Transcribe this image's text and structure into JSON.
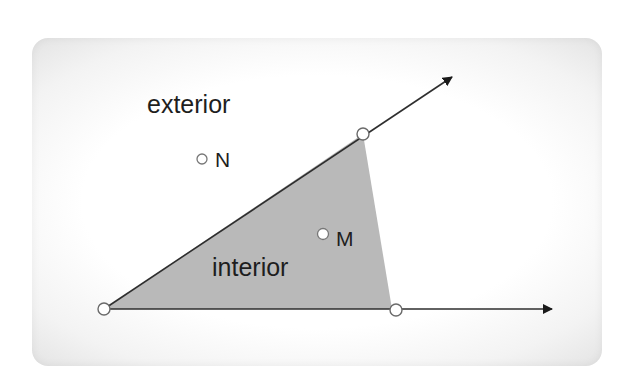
{
  "diagram": {
    "region_labels": {
      "exterior": "exterior",
      "interior": "interior"
    },
    "points": {
      "N": {
        "label": "N",
        "location": "exterior"
      },
      "M": {
        "label": "M",
        "location": "interior"
      }
    },
    "rays": [
      {
        "name": "upper-ray",
        "from": "vertex",
        "direction": "up-right",
        "arrow": true
      },
      {
        "name": "lower-ray",
        "from": "vertex",
        "direction": "right",
        "arrow": true
      }
    ],
    "colors": {
      "interior_fill": "#b9b9b9",
      "ray_stroke": "#2e2e2e",
      "point_fill": "#ffffff",
      "point_stroke": "#6a6a6a",
      "text": "#1e1e1e"
    }
  }
}
